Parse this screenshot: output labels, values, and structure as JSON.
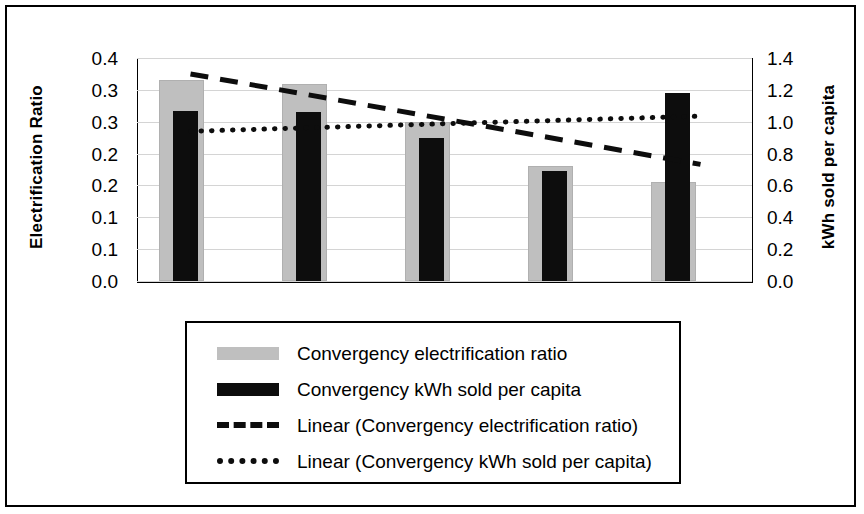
{
  "chart_data": {
    "type": "bar",
    "title": "",
    "subtitle": "",
    "xlabel": "",
    "ylabel": "Electrification Ratio",
    "y2label": "kWh sold per capita",
    "grid": true,
    "legend_position": "bottom",
    "categories": [
      "1",
      "2",
      "3",
      "4",
      "5"
    ],
    "ylim": [
      0.0,
      0.35
    ],
    "y2lim": [
      0.0,
      1.4
    ],
    "yticks": [
      0.35,
      0.3,
      0.25,
      0.2,
      0.15,
      0.1,
      0.05,
      0.0
    ],
    "ytick_labels": [
      "0.4",
      "0.3",
      "0.3",
      "0.2",
      "0.2",
      "0.1",
      "0.1",
      "0.0"
    ],
    "y2ticks": [
      1.4,
      1.2,
      1.0,
      0.8,
      0.6,
      0.4,
      0.2,
      0.0
    ],
    "y2tick_labels": [
      "1.4",
      "1.2",
      "1.0",
      "0.8",
      "0.6",
      "0.4",
      "0.2",
      "0.0"
    ],
    "series": [
      {
        "name": "Convergency electrification ratio",
        "type": "bar",
        "axis": "left",
        "color": "#bfbfbf",
        "values": [
          0.315,
          0.31,
          0.25,
          0.18,
          0.155
        ]
      },
      {
        "name": "Convergency kWh sold per capita",
        "type": "bar",
        "axis": "right",
        "color": "#0d0d0d",
        "values": [
          1.07,
          1.06,
          0.9,
          0.69,
          1.18
        ]
      },
      {
        "name": "Linear (Convergency electrification ratio)",
        "type": "trendline",
        "style": "dashed",
        "axis": "left",
        "color": "#0d0d0d",
        "start_value": 0.325,
        "end_value": 0.183
      },
      {
        "name": "Linear (Convergency kWh sold per capita)",
        "type": "trendline",
        "style": "dotted",
        "axis": "right",
        "color": "#0d0d0d",
        "start_value": 0.94,
        "end_value": 1.035
      }
    ]
  },
  "axes": {
    "left_title": "Electrification Ratio",
    "right_title": "kWh sold per capita",
    "left_ticks": [
      "0.4",
      "0.3",
      "0.3",
      "0.2",
      "0.2",
      "0.1",
      "0.1",
      "0.0"
    ],
    "right_ticks": [
      "1.4",
      "1.2",
      "1.0",
      "0.8",
      "0.6",
      "0.4",
      "0.2",
      "0.0"
    ]
  },
  "legend": {
    "items": [
      {
        "label": "Convergency electrification ratio",
        "marker": "gray-bar-swatch"
      },
      {
        "label": "Convergency kWh sold per capita",
        "marker": "black-bar-swatch"
      },
      {
        "label": "Linear (Convergency electrification ratio)",
        "marker": "dashed-line-swatch"
      },
      {
        "label": "Linear (Convergency kWh sold per capita)",
        "marker": "dotted-line-swatch"
      }
    ]
  }
}
